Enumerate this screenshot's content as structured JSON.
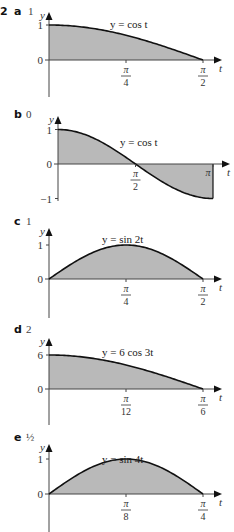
{
  "question_number": "2",
  "chart_data": [
    {
      "type": "area",
      "part": "a",
      "answer": "1",
      "function_label": "y = cos t",
      "func": "cos",
      "amplitude": 1,
      "frequency": 1,
      "xlabel": "t",
      "ylabel": "y",
      "xlim": [
        0,
        1.5708
      ],
      "ylim": [
        0,
        1
      ],
      "y_ticks": [
        {
          "value": 1,
          "label": "1"
        },
        {
          "value": 0,
          "label": "0"
        }
      ],
      "x_ticks": [
        {
          "value": 0.7854,
          "num": "π",
          "den": "4"
        },
        {
          "value": 1.5708,
          "num": "π",
          "den": "2"
        }
      ],
      "shaded_interval": [
        0,
        1.5708
      ]
    },
    {
      "type": "area",
      "part": "b",
      "answer": "0",
      "function_label": "y = cos t",
      "func": "cos",
      "amplitude": 1,
      "frequency": 1,
      "xlabel": "t",
      "ylabel": "y",
      "xlim": [
        0,
        3.1416
      ],
      "ylim": [
        -1,
        1
      ],
      "y_ticks": [
        {
          "value": 1,
          "label": "1"
        },
        {
          "value": 0,
          "label": "0"
        },
        {
          "value": -1,
          "label": "−1"
        }
      ],
      "x_ticks": [
        {
          "value": 1.5708,
          "num": "π",
          "den": "2"
        },
        {
          "value": 3.1416,
          "label": "π"
        }
      ],
      "shaded_interval": [
        0,
        3.1416
      ]
    },
    {
      "type": "area",
      "part": "c",
      "answer": "1",
      "function_label": "y = sin 2t",
      "func": "sin",
      "amplitude": 1,
      "frequency": 2,
      "xlabel": "t",
      "ylabel": "y",
      "xlim": [
        0,
        1.5708
      ],
      "ylim": [
        0,
        1
      ],
      "y_ticks": [
        {
          "value": 1,
          "label": "1"
        },
        {
          "value": 0,
          "label": "0"
        }
      ],
      "x_ticks": [
        {
          "value": 0.7854,
          "num": "π",
          "den": "4"
        },
        {
          "value": 1.5708,
          "num": "π",
          "den": "2"
        }
      ],
      "shaded_interval": [
        0,
        1.5708
      ]
    },
    {
      "type": "area",
      "part": "d",
      "answer": "2",
      "function_label": "y = 6 cos 3t",
      "func": "cos",
      "amplitude": 6,
      "frequency": 3,
      "xlabel": "t",
      "ylabel": "y",
      "xlim": [
        0,
        0.5236
      ],
      "ylim": [
        0,
        6
      ],
      "y_ticks": [
        {
          "value": 6,
          "label": "6"
        },
        {
          "value": 0,
          "label": "0"
        }
      ],
      "x_ticks": [
        {
          "value": 0.2618,
          "num": "π",
          "den": "12"
        },
        {
          "value": 0.5236,
          "num": "π",
          "den": "6"
        }
      ],
      "shaded_interval": [
        0,
        0.5236
      ]
    },
    {
      "type": "area",
      "part": "e",
      "answer": "½",
      "function_label": "y = sin 4t",
      "func": "sin",
      "amplitude": 1,
      "frequency": 4,
      "xlabel": "t",
      "ylabel": "y",
      "xlim": [
        0,
        0.7854
      ],
      "ylim": [
        0,
        1
      ],
      "y_ticks": [
        {
          "value": 1,
          "label": "1"
        },
        {
          "value": 0,
          "label": "0"
        }
      ],
      "x_ticks": [
        {
          "value": 0.3927,
          "num": "π",
          "den": "8"
        },
        {
          "value": 0.7854,
          "num": "π",
          "den": "4"
        }
      ],
      "shaded_interval": [
        0,
        0.7854
      ]
    }
  ],
  "colors": {
    "fill": "#b9b9b9",
    "curve": "#111111",
    "axis": "#444444"
  }
}
